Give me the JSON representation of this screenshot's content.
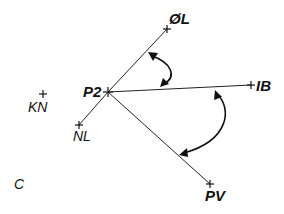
{
  "diagram": {
    "type": "angle-diagram",
    "colors": {
      "ink": "#111111",
      "background": "#ffffff"
    },
    "center": {
      "id": "P2",
      "label": "P2",
      "x": 108,
      "y": 92
    },
    "points": [
      {
        "id": "OL",
        "label": "ØL",
        "x": 167,
        "y": 29,
        "connected": true
      },
      {
        "id": "IB",
        "label": "IB",
        "x": 251,
        "y": 85,
        "connected": true
      },
      {
        "id": "PV",
        "label": "PV",
        "x": 210,
        "y": 184,
        "connected": true
      },
      {
        "id": "NL",
        "label": "NL",
        "x": 79,
        "y": 125,
        "connected": true
      },
      {
        "id": "KN",
        "label": "KN",
        "x": 43,
        "y": 94,
        "connected": false
      }
    ],
    "angles": [
      {
        "id": "angle-OL-IB",
        "from": "OL",
        "to": "IB",
        "bidirectional": true
      },
      {
        "id": "angle-IB-PV",
        "from": "IB",
        "to": "PV",
        "bidirectional": true
      }
    ],
    "corner_label": "C"
  }
}
